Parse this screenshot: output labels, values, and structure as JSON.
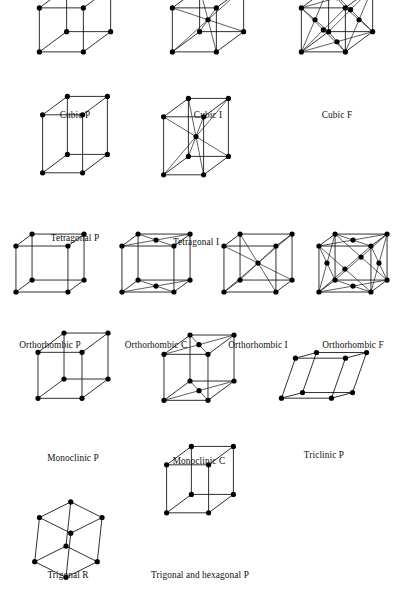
{
  "figure": {
    "background_color": "#ffffff",
    "line_color": "#0b0b0b",
    "node_color": "#000000",
    "label_color": "#101010",
    "width": 394,
    "height": 598
  },
  "lattices": [
    {
      "id": "cubic-p",
      "label": "Cubic P",
      "row": 1,
      "cx": 75,
      "cy": 62,
      "label_x": 75,
      "label_y": 118,
      "a": 44,
      "b": 44,
      "c": 44,
      "skew_x": 0,
      "skew_y": 0,
      "centering": "P",
      "lattice_points": 8
    },
    {
      "id": "cubic-i",
      "label": "Cubic I",
      "row": 1,
      "cx": 208,
      "cy": 62,
      "label_x": 208,
      "label_y": 118,
      "a": 44,
      "b": 44,
      "c": 44,
      "skew_x": 0,
      "skew_y": 0,
      "centering": "I",
      "lattice_points": 9
    },
    {
      "id": "cubic-f",
      "label": "Cubic F",
      "row": 1,
      "cx": 337,
      "cy": 62,
      "label_x": 337,
      "label_y": 118,
      "a": 44,
      "b": 44,
      "c": 44,
      "skew_x": 0,
      "skew_y": 0,
      "centering": "F",
      "lattice_points": 14
    },
    {
      "id": "tetragonal-p",
      "label": "Tetragonal P",
      "row": 2,
      "cx": 75,
      "cy": 182,
      "label_x": 75,
      "label_y": 241,
      "a": 40,
      "b": 40,
      "c": 58,
      "skew_x": 0,
      "skew_y": 0,
      "centering": "P",
      "lattice_points": 8
    },
    {
      "id": "tetragonal-i",
      "label": "Tetragonal I",
      "row": 2,
      "cx": 196,
      "cy": 184,
      "label_x": 196,
      "label_y": 245,
      "a": 40,
      "b": 40,
      "c": 58,
      "skew_x": 0,
      "skew_y": 0,
      "centering": "I",
      "lattice_points": 9
    },
    {
      "id": "orthorhombic-p",
      "label": "Orthorhombic P",
      "row": 3,
      "cx": 50,
      "cy": 298,
      "label_x": 50,
      "label_y": 348,
      "a": 52,
      "b": 26,
      "c": 46,
      "skew_x": 0,
      "skew_y": 0,
      "centering": "P",
      "lattice_points": 8
    },
    {
      "id": "orthorhombic-c",
      "label": "Orthorhombic C",
      "row": 3,
      "cx": 156,
      "cy": 298,
      "label_x": 156,
      "label_y": 348,
      "a": 52,
      "b": 26,
      "c": 46,
      "skew_x": 0,
      "skew_y": 0,
      "centering": "C",
      "lattice_points": 10
    },
    {
      "id": "orthorhombic-i",
      "label": "Orthorhombic I",
      "row": 3,
      "cx": 258,
      "cy": 298,
      "label_x": 258,
      "label_y": 348,
      "a": 52,
      "b": 26,
      "c": 46,
      "skew_x": 0,
      "skew_y": 0,
      "centering": "I",
      "lattice_points": 9
    },
    {
      "id": "orthorhombic-f",
      "label": "Orthorhombic F",
      "row": 3,
      "cx": 353,
      "cy": 298,
      "label_x": 353,
      "label_y": 348,
      "a": 52,
      "b": 26,
      "c": 46,
      "skew_x": 0,
      "skew_y": 0,
      "centering": "F",
      "lattice_points": 14
    },
    {
      "id": "monoclinic-p",
      "label": "Monoclinic P",
      "row": 4,
      "cx": 73,
      "cy": 408,
      "label_x": 73,
      "label_y": 461,
      "a": 44,
      "b": 42,
      "c": 46,
      "skew_x": 0,
      "skew_y": 0,
      "centering": "P",
      "lattice_points": 8
    },
    {
      "id": "monoclinic-c",
      "label": "Monoclinic C",
      "row": 4,
      "cx": 199,
      "cy": 410,
      "label_x": 199,
      "label_y": 464,
      "a": 44,
      "b": 42,
      "c": 46,
      "skew_x": 0,
      "skew_y": 0,
      "centering": "C",
      "lattice_points": 10
    },
    {
      "id": "triclinic-p",
      "label": "Triclinic P",
      "row": 4,
      "cx": 324,
      "cy": 406,
      "label_x": 324,
      "label_y": 458,
      "a": 50,
      "b": 34,
      "c": 40,
      "skew_x": 14,
      "skew_y": 10,
      "centering": "P",
      "lattice_points": 8
    },
    {
      "id": "trigonal-r",
      "label": "Trigonal R",
      "row": 5,
      "cx": 68,
      "cy": 525,
      "label_x": 68,
      "label_y": 578,
      "a": 34,
      "b": 34,
      "c": 34,
      "skew_x": 0,
      "skew_y": 0,
      "centering": "R",
      "lattice_points": 8
    },
    {
      "id": "trigonal-hexagonal-p",
      "label": "Trigonal and hexagonal P",
      "row": 5,
      "cx": 200,
      "cy": 522,
      "label_x": 200,
      "label_y": 578,
      "a": 42,
      "b": 40,
      "c": 48,
      "skew_x": 0,
      "skew_y": 0,
      "centering": "P",
      "lattice_points": 8
    }
  ],
  "projection": {
    "note": "oblique projection, depth axis up-right",
    "depth_dx": 0.62,
    "depth_dy": -0.46,
    "node_radius": 2.6
  }
}
